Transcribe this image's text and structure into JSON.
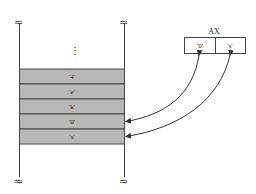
{
  "diagram": {
    "colors": {
      "cell_fill": "#b8b8b8",
      "line": "#444444",
      "background": "#ffffff"
    },
    "break_symbol": "≈",
    "ellipsis": "⋮",
    "memory": {
      "cells": [
        {
          "label": "'4'"
        },
        {
          "label": "'e'"
        },
        {
          "label": "'k'"
        },
        {
          "label": "'0'"
        },
        {
          "label": "'s'"
        }
      ]
    },
    "register": {
      "name": "AX",
      "slots": [
        {
          "label": "'0'"
        },
        {
          "label": "'s'"
        }
      ]
    },
    "arrows": [
      {
        "from": "AX slot '0'",
        "to": "memory cell '0'"
      },
      {
        "from": "AX slot 's'",
        "to": "memory cell 's'"
      }
    ]
  }
}
